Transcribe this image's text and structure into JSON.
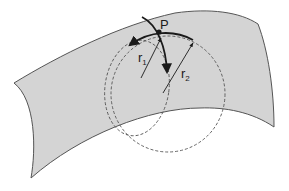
{
  "figure": {
    "colors": {
      "surface_fill": "#d4d4d4",
      "surface_edge": "#555555",
      "curve": "#1a1a1a",
      "dashed_circle": "#555555",
      "background": "#ffffff"
    }
  },
  "labels": {
    "point": "P",
    "radius1": {
      "main": "r",
      "sub": "1"
    },
    "radius2": {
      "main": "r",
      "sub": "2"
    }
  }
}
